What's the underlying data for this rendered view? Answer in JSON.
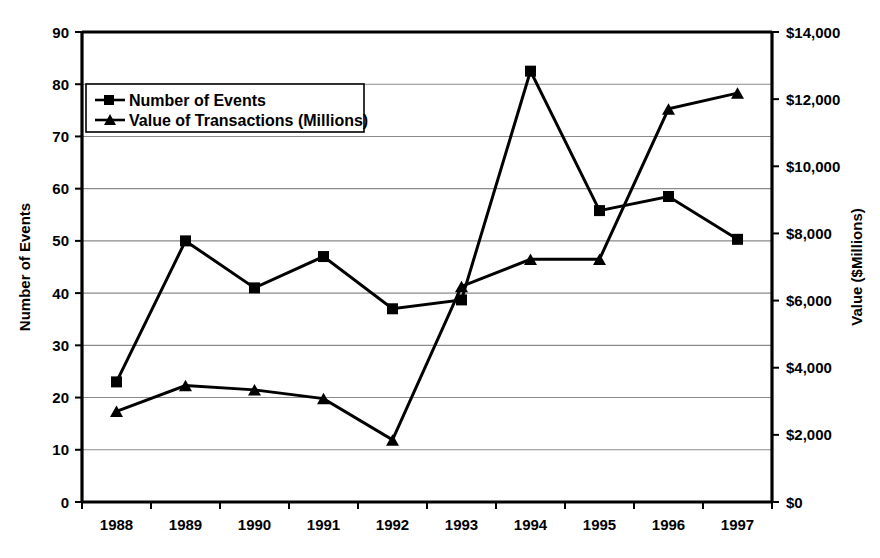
{
  "chart_data": {
    "type": "line",
    "title": "",
    "categories": [
      "1988",
      "1989",
      "1990",
      "1991",
      "1992",
      "1993",
      "1994",
      "1995",
      "1996",
      "1997"
    ],
    "xlabel": "",
    "series": [
      {
        "name": "Number of Events",
        "axis": "left",
        "marker": "square",
        "values": [
          23,
          50,
          41,
          47,
          37,
          38.7,
          82.5,
          55.8,
          58.5,
          50.3
        ]
      },
      {
        "name": "Value of Transactions (Millions)",
        "axis": "right",
        "marker": "triangle",
        "values": [
          2700,
          3470,
          3340,
          3080,
          1850,
          6420,
          7230,
          7230,
          11710,
          12180
        ]
      }
    ],
    "left_axis": {
      "label": "Number of Events",
      "ylim": [
        0,
        90
      ],
      "ticks": [
        0,
        10,
        20,
        30,
        40,
        50,
        60,
        70,
        80,
        90
      ],
      "tick_labels": [
        "0",
        "10",
        "20",
        "30",
        "40",
        "50",
        "60",
        "70",
        "80",
        "90"
      ]
    },
    "right_axis": {
      "label": "Value ($Millions)",
      "ylim": [
        0,
        14000
      ],
      "ticks": [
        0,
        2000,
        4000,
        6000,
        8000,
        10000,
        12000,
        14000
      ],
      "tick_labels": [
        "$0",
        "$2,000",
        "$4,000",
        "$6,000",
        "$8,000",
        "$10,000",
        "$12,000",
        "$14,000"
      ]
    },
    "grid": true,
    "legend_position": "top-left",
    "legend_entries": [
      "Number of Events",
      "Value of Transactions (Millions)"
    ],
    "colors": {
      "line": "#000000",
      "grid": "#8a8a8a",
      "axis": "#000000",
      "background": "#ffffff"
    }
  }
}
